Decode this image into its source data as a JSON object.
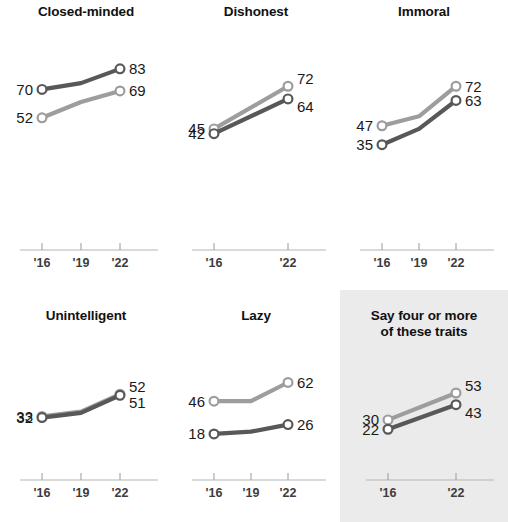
{
  "chart_data": {
    "type": "line",
    "title": "",
    "xlabel": "",
    "ylabel": "",
    "ylim": [
      0,
      100
    ],
    "grid": false,
    "legend_position": "none",
    "x": [
      "'16",
      "'19",
      "'22"
    ],
    "colors": {
      "dark_series": "#585858",
      "light_series": "#9d9d9d",
      "highlight_background": "#ebebeb",
      "axis": "#b5b5b5"
    },
    "panels": [
      {
        "title": "Closed-minded",
        "highlighted": false,
        "ticks": [
          "'16",
          "'19",
          "'22"
        ],
        "series": [
          {
            "name": "dark",
            "values": [
              70,
              74,
              83
            ],
            "start_label": "70",
            "end_label": "83"
          },
          {
            "name": "light",
            "values": [
              52,
              62,
              69
            ],
            "start_label": "52",
            "end_label": "69"
          }
        ]
      },
      {
        "title": "Dishonest",
        "highlighted": false,
        "ticks": [
          "'16",
          "'22"
        ],
        "series": [
          {
            "name": "light",
            "values": [
              45,
              72
            ],
            "start_label": "45",
            "end_label": "72"
          },
          {
            "name": "dark",
            "values": [
              42,
              64
            ],
            "start_label": "42",
            "end_label": "64"
          }
        ]
      },
      {
        "title": "Immoral",
        "highlighted": false,
        "ticks": [
          "'16",
          "'19",
          "'22"
        ],
        "series": [
          {
            "name": "light",
            "values": [
              47,
              53,
              72
            ],
            "start_label": "47",
            "end_label": "72"
          },
          {
            "name": "dark",
            "values": [
              35,
              45,
              63
            ],
            "start_label": "35",
            "end_label": "63"
          }
        ]
      },
      {
        "title": "Unintelligent",
        "highlighted": false,
        "ticks": [
          "'16",
          "'19",
          "'22"
        ],
        "series": [
          {
            "name": "light",
            "values": [
              33,
              37,
              52
            ],
            "start_label": "33",
            "end_label": "52"
          },
          {
            "name": "dark",
            "values": [
              32,
              36,
              51
            ],
            "start_label": "32",
            "end_label": "51"
          }
        ]
      },
      {
        "title": "Lazy",
        "highlighted": false,
        "ticks": [
          "'16",
          "'19",
          "'22"
        ],
        "series": [
          {
            "name": "light",
            "values": [
              46,
              46,
              62
            ],
            "start_label": "46",
            "end_label": "62"
          },
          {
            "name": "dark",
            "values": [
              18,
              20,
              26
            ],
            "start_label": "18",
            "end_label": "26"
          }
        ]
      },
      {
        "title": "Say four or more\nof these traits",
        "highlighted": true,
        "ticks": [
          "'16",
          "'22"
        ],
        "series": [
          {
            "name": "light",
            "values": [
              30,
              53
            ],
            "start_label": "30",
            "end_label": "53"
          },
          {
            "name": "dark",
            "values": [
              22,
              43
            ],
            "start_label": "22",
            "end_label": "43"
          }
        ]
      }
    ]
  }
}
